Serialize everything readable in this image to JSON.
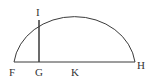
{
  "diagram": {
    "type": "geometry",
    "stroke_color": "#3a3a3a",
    "points": {
      "F": {
        "label": "F",
        "x": 14,
        "y": 62
      },
      "G": {
        "label": "G",
        "x": 39,
        "y": 62
      },
      "K": {
        "label": "K",
        "x": 75,
        "y": 62
      },
      "H": {
        "label": "H",
        "x": 135,
        "y": 62
      },
      "I": {
        "label": "I",
        "x": 39,
        "y": 20
      }
    },
    "segments": [
      {
        "from": "F",
        "to": "H",
        "name": "diameter"
      },
      {
        "from": "G",
        "to": "I",
        "name": "perpendicular"
      }
    ],
    "arc": {
      "from": "F",
      "to": "H",
      "center": "K"
    }
  }
}
